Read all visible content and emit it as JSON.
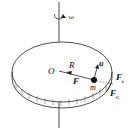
{
  "diagram": {
    "type": "rotating-disk-force-diagram",
    "labels": {
      "omega": "ω",
      "origin": "O",
      "radius": "R",
      "velocity": "u",
      "force": "F",
      "mass": "m",
      "force_t_base": "F",
      "force_t_sub": "t",
      "force_c_base": "F",
      "force_c_sub": "C"
    },
    "colors": {
      "stroke": "#222222",
      "background": "#ffffff"
    }
  }
}
